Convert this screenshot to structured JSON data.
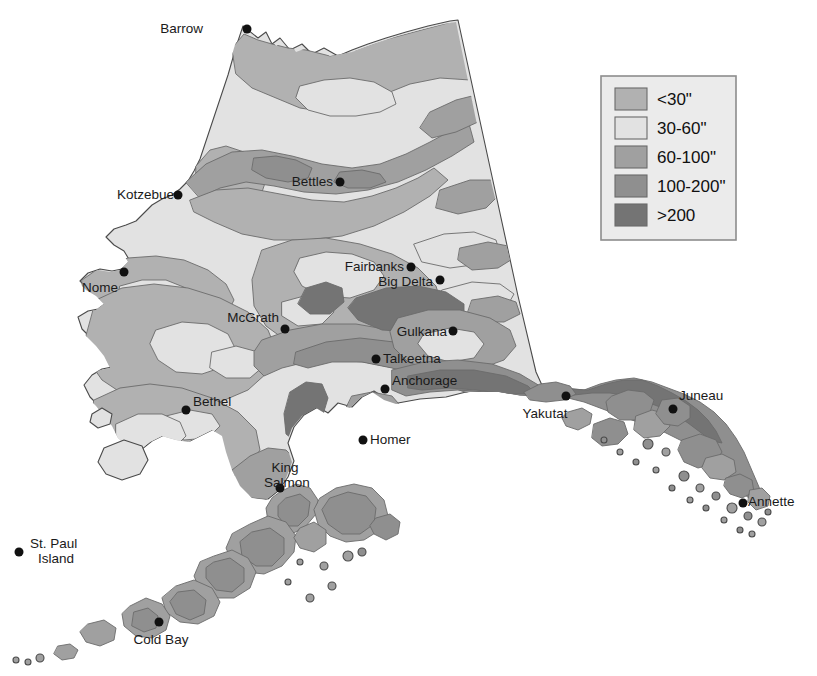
{
  "map": {
    "title": "Alaska Mean Annual Precipitation",
    "region": "Alaska",
    "background_color": "#ffffff",
    "coastline_color": "#4a4a4a",
    "contour_line_color": "#6b6b6b"
  },
  "legend": {
    "box_fill": "#ebebeb",
    "box_border": "#8d8d8d",
    "items": [
      {
        "label": "<30\"",
        "color": "#b1b1b1",
        "range_min": null,
        "range_max": 30
      },
      {
        "label": "30-60\"",
        "color": "#e2e2e2",
        "range_min": 30,
        "range_max": 60
      },
      {
        "label": "60-100\"",
        "color": "#a0a0a0",
        "range_min": 60,
        "range_max": 100
      },
      {
        "label": "100-200\"",
        "color": "#8f8f8f",
        "range_min": 100,
        "range_max": 200
      },
      {
        "label": ">200",
        "color": "#747474",
        "range_min": 200,
        "range_max": null
      }
    ]
  },
  "cities": [
    {
      "name": "Barrow",
      "label": "Barrow",
      "x": 247,
      "y": 29,
      "label_x": 203,
      "label_y": 33,
      "anchor": "end",
      "lines": [
        "Barrow"
      ]
    },
    {
      "name": "Kotzebue",
      "label": "Kotzebue",
      "x": 178,
      "y": 195,
      "label_x": 174,
      "label_y": 199,
      "anchor": "end",
      "lines": [
        "Kotzebue"
      ]
    },
    {
      "name": "Bettles",
      "label": "Bettles",
      "x": 340,
      "y": 182,
      "label_x": 333,
      "label_y": 186,
      "anchor": "end",
      "lines": [
        "Bettles"
      ]
    },
    {
      "name": "Nome",
      "label": "Nome",
      "x": 124,
      "y": 272,
      "label_x": 118,
      "label_y": 292,
      "anchor": "end",
      "lines": [
        "Nome"
      ]
    },
    {
      "name": "Fairbanks",
      "label": "Fairbanks",
      "x": 411,
      "y": 267,
      "label_x": 404,
      "label_y": 271,
      "anchor": "end",
      "lines": [
        "Fairbanks"
      ]
    },
    {
      "name": "Big Delta",
      "label": "Big Delta",
      "x": 440,
      "y": 280,
      "label_x": 433,
      "label_y": 286,
      "anchor": "end",
      "lines": [
        "Big Delta"
      ]
    },
    {
      "name": "McGrath",
      "label": "McGrath",
      "x": 285,
      "y": 329,
      "label_x": 279,
      "label_y": 322,
      "anchor": "end",
      "lines": [
        "McGrath"
      ]
    },
    {
      "name": "Gulkana",
      "label": "Gulkana",
      "x": 453,
      "y": 331,
      "label_x": 447,
      "label_y": 336,
      "anchor": "end",
      "lines": [
        "Gulkana"
      ]
    },
    {
      "name": "Talkeetna",
      "label": "Talkeetna",
      "x": 376,
      "y": 359,
      "label_x": 383,
      "label_y": 363,
      "anchor": "start",
      "lines": [
        "Talkeetna"
      ]
    },
    {
      "name": "Anchorage",
      "label": "Anchorage",
      "x": 385,
      "y": 389,
      "label_x": 392,
      "label_y": 385,
      "anchor": "start",
      "lines": [
        "Anchorage"
      ]
    },
    {
      "name": "Bethel",
      "label": "Bethel",
      "x": 186,
      "y": 410,
      "label_x": 193,
      "label_y": 406,
      "anchor": "start",
      "lines": [
        "Bethel"
      ]
    },
    {
      "name": "Homer",
      "label": "Homer",
      "x": 363,
      "y": 440,
      "label_x": 370,
      "label_y": 444,
      "anchor": "start",
      "lines": [
        "Homer"
      ]
    },
    {
      "name": "Yakutat",
      "label": "Yakutat",
      "x": 566,
      "y": 396,
      "label_x": 545,
      "label_y": 418,
      "anchor": "middle",
      "lines": [
        "Yakutat"
      ]
    },
    {
      "name": "Juneau",
      "label": "Juneau",
      "x": 673,
      "y": 409,
      "label_x": 679,
      "label_y": 400,
      "anchor": "start",
      "lines": [
        "Juneau"
      ]
    },
    {
      "name": "King Salmon",
      "label": "King Salmon",
      "x": 280,
      "y": 488,
      "label_x": 287,
      "label_y": 472,
      "anchor": "middle",
      "lines": [
        "King",
        "Salmon"
      ]
    },
    {
      "name": "Annette",
      "label": "Annette",
      "x": 743,
      "y": 503,
      "label_x": 748,
      "label_y": 506,
      "anchor": "start",
      "lines": [
        "Annette"
      ]
    },
    {
      "name": "St. Paul Island",
      "label": "St. Paul Island",
      "x": 19,
      "y": 552,
      "label_x": 30,
      "label_y": 548,
      "anchor": "start",
      "lines": [
        "St. Paul",
        "Island"
      ]
    },
    {
      "name": "Cold Bay",
      "label": "Cold Bay",
      "x": 159,
      "y": 622,
      "label_x": 161,
      "label_y": 644,
      "anchor": "middle",
      "lines": [
        "Cold Bay"
      ]
    }
  ]
}
